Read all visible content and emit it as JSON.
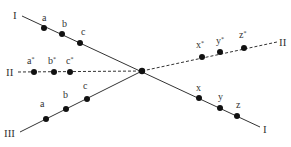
{
  "diagram": {
    "type": "three-line-intersection",
    "center": {
      "x": 142,
      "y": 71
    },
    "lines": [
      {
        "id": "I",
        "style": "solid",
        "start": {
          "x": 22,
          "y": 16
        },
        "end": {
          "x": 260,
          "y": 127
        },
        "start_label": "I",
        "end_label": "I",
        "points": [
          {
            "label": "a",
            "x": 44,
            "y": 28
          },
          {
            "label": "b",
            "x": 62,
            "y": 34
          },
          {
            "label": "c",
            "x": 80,
            "y": 43
          },
          {
            "label": "x",
            "x": 199,
            "y": 98
          },
          {
            "label": "y",
            "x": 220,
            "y": 108
          },
          {
            "label": "z",
            "x": 237,
            "y": 116
          }
        ]
      },
      {
        "id": "II",
        "style": "dashed",
        "start": {
          "x": 18,
          "y": 72
        },
        "end": {
          "x": 277,
          "y": 42
        },
        "start_label": "II",
        "end_label": "II",
        "points": [
          {
            "label": "a*",
            "x": 34,
            "y": 72
          },
          {
            "label": "b*",
            "x": 54,
            "y": 72
          },
          {
            "label": "c*",
            "x": 70,
            "y": 72
          },
          {
            "label": "x*",
            "x": 202,
            "y": 57
          },
          {
            "label": "y*",
            "x": 220,
            "y": 52
          },
          {
            "label": "z*",
            "x": 244,
            "y": 48
          }
        ]
      },
      {
        "id": "III",
        "style": "solid",
        "start": {
          "x": 20,
          "y": 132
        },
        "end": {
          "x": 142,
          "y": 71
        },
        "start_label": "III",
        "points": [
          {
            "label": "a",
            "x": 46,
            "y": 119
          },
          {
            "label": "b",
            "x": 66,
            "y": 109
          },
          {
            "label": "c",
            "x": 87,
            "y": 99
          }
        ]
      }
    ]
  },
  "labels": {
    "line1_start": "I",
    "line1_end": "I",
    "line2_start": "II",
    "line2_end": "II",
    "line3_start": "III",
    "l1_a": "a",
    "l1_b": "b",
    "l1_c": "c",
    "l1_x": "x",
    "l1_y": "y",
    "l1_z": "z",
    "l2_a": "a",
    "l2_b": "b",
    "l2_c": "c",
    "l2_x": "x",
    "l2_y": "y",
    "l2_z": "z",
    "star": "*",
    "l3_a": "a",
    "l3_b": "b",
    "l3_c": "c"
  },
  "colors": {
    "line": "#333333",
    "point": "#111111",
    "text": "#333333",
    "background": "#ffffff"
  }
}
